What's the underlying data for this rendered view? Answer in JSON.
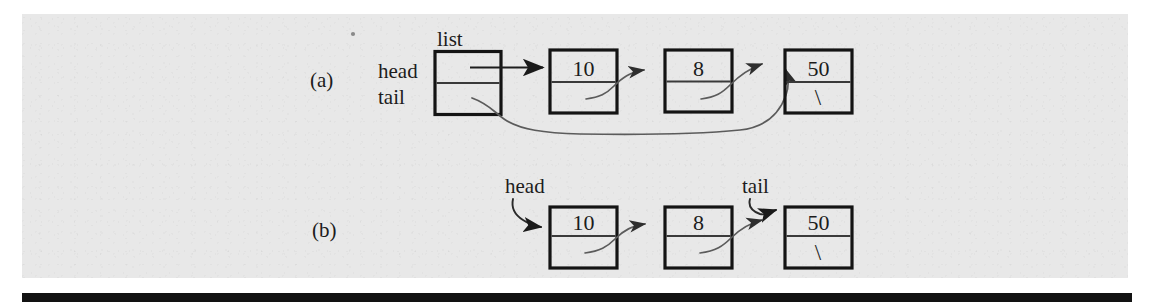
{
  "figure": {
    "background_color": "#e8e8e8",
    "rule_color": "#121212",
    "panels": [
      {
        "id": "a",
        "label": "(a)",
        "struct_box": {
          "name": "list",
          "caption": "list",
          "fields": [
            {
              "name": "head",
              "label": "head"
            },
            {
              "name": "tail",
              "label": "tail"
            }
          ]
        },
        "nodes": [
          {
            "value": "10",
            "next_null": false
          },
          {
            "value": "8",
            "next_null": false
          },
          {
            "value": "50",
            "next_null": true,
            "null_glyph": "\\"
          }
        ],
        "pointers": [
          {
            "from": "list.head",
            "to": "node-10",
            "style": "straight"
          },
          {
            "from": "list.tail",
            "to": "node-50",
            "style": "curve-long"
          },
          {
            "from": "node-10.next",
            "to": "node-8",
            "style": "curve"
          },
          {
            "from": "node-8.next",
            "to": "node-50",
            "style": "curve"
          }
        ]
      },
      {
        "id": "b",
        "label": "(b)",
        "labels": [
          {
            "name": "head",
            "text": "head",
            "target": "node-10"
          },
          {
            "name": "tail",
            "text": "tail",
            "target": "node-50"
          }
        ],
        "nodes": [
          {
            "value": "10",
            "next_null": false
          },
          {
            "value": "8",
            "next_null": false
          },
          {
            "value": "50",
            "next_null": true,
            "null_glyph": "\\"
          }
        ],
        "pointers": [
          {
            "from": "head",
            "to": "node-10",
            "style": "curve-label"
          },
          {
            "from": "tail",
            "to": "node-50",
            "style": "curve-label"
          },
          {
            "from": "node-10.next",
            "to": "node-8",
            "style": "curve"
          },
          {
            "from": "node-8.next",
            "to": "node-50",
            "style": "curve"
          }
        ]
      }
    ]
  }
}
